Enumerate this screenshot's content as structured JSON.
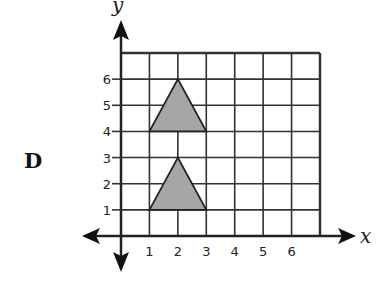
{
  "option_label": "D",
  "axes": {
    "x_label": "x",
    "y_label": "y"
  },
  "x_ticks": [
    "1",
    "2",
    "3",
    "4",
    "5",
    "6"
  ],
  "y_ticks": [
    "1",
    "2",
    "3",
    "4",
    "5",
    "6"
  ],
  "grid": {
    "x_min": 0,
    "x_max": 7,
    "y_min": 0,
    "y_max": 7
  },
  "shapes": [
    {
      "name": "upper-triangle",
      "vertices": [
        [
          1,
          4
        ],
        [
          2,
          6
        ],
        [
          3,
          4
        ]
      ],
      "fill": "#a6a6a6"
    },
    {
      "name": "lower-triangle",
      "vertices": [
        [
          1,
          1
        ],
        [
          2,
          3
        ],
        [
          3,
          1
        ]
      ],
      "fill": "#a6a6a6"
    }
  ],
  "colors": {
    "line": "#222222",
    "fill": "#a6a6a6"
  }
}
